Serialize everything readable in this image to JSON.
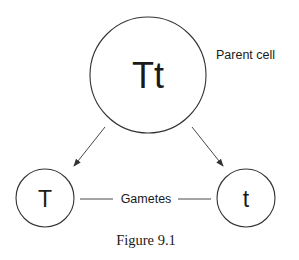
{
  "diagram": {
    "parent_cell": {
      "genotype": "Tt",
      "label": "Parent cell"
    },
    "gametes": {
      "label": "Gametes",
      "left": {
        "allele": "T"
      },
      "right": {
        "allele": "t"
      }
    },
    "caption": "Figure 9.1",
    "colors": {
      "stroke": "#333333",
      "text": "#1a1a1a",
      "background": "#ffffff"
    }
  }
}
